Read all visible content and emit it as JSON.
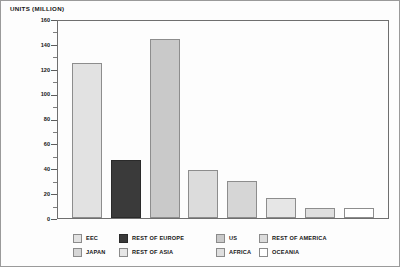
{
  "chart_data": {
    "type": "bar",
    "title": "UNITS (MILLION)",
    "xlabel": "",
    "ylabel": "UNITS (MILLION)",
    "ylim": [
      0,
      160
    ],
    "ytick_step": 20,
    "yminor_step": 10,
    "grid": false,
    "legend_position": "bottom",
    "yticks": [
      "0",
      "20",
      "40",
      "60",
      "80",
      "100",
      "120",
      "140",
      "160"
    ],
    "categories": [
      "EEC",
      "REST OF EUROPE",
      "US",
      "REST OF AMERICA",
      "JAPAN",
      "REST OF ASIA",
      "AFRICA",
      "OCEANIA"
    ],
    "values": [
      125,
      47,
      144,
      39,
      30,
      16,
      8,
      8
    ],
    "colors": [
      "#e2e2e2",
      "#3a3a3a",
      "#c9c9c9",
      "#dcdcdc",
      "#d6d6d6",
      "#e6e6e6",
      "#dfdfdf",
      "#ffffff"
    ],
    "series": [
      {
        "name": "Units",
        "values": [
          125,
          47,
          144,
          39,
          30,
          16,
          8,
          8
        ]
      }
    ]
  },
  "legend": {
    "row1": [
      {
        "label": "EEC",
        "color": "#e2e2e2"
      },
      {
        "label": "REST OF EUROPE",
        "color": "#3a3a3a"
      },
      {
        "label": "US",
        "color": "#c9c9c9"
      },
      {
        "label": "REST OF AMERICA",
        "color": "#dcdcdc"
      }
    ],
    "row2": [
      {
        "label": "JAPAN",
        "color": "#d6d6d6"
      },
      {
        "label": "REST OF ASIA",
        "color": "#e6e6e6"
      },
      {
        "label": "AFRICA",
        "color": "#dfdfdf"
      },
      {
        "label": "OCEANIA",
        "color": "#ffffff"
      }
    ]
  }
}
